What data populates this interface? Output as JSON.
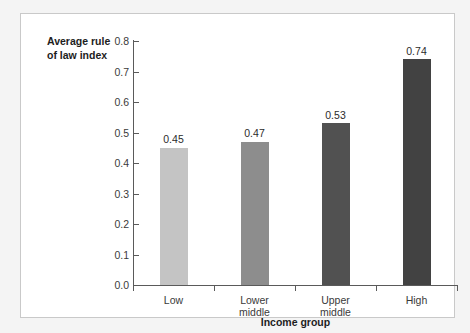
{
  "chart_data": {
    "type": "bar",
    "title": "",
    "xlabel": "Income group",
    "ylabel": "Average rule\nof law index",
    "categories": [
      "Low",
      "Lower\nmiddle",
      "Upper\nmiddle",
      "High"
    ],
    "values": [
      0.45,
      0.47,
      0.53,
      0.74
    ],
    "value_labels": [
      "0.45",
      "0.47",
      "0.53",
      "0.74"
    ],
    "bar_colors": [
      "#c4c4c4",
      "#8d8d8d",
      "#515151",
      "#424242"
    ],
    "ylim": [
      0.0,
      0.8
    ],
    "ytick_labels": [
      "0.8",
      "0.7",
      "0.6",
      "0.5",
      "0.4",
      "0.3",
      "0.2",
      "0.1",
      "0.0"
    ],
    "ytick_values": [
      0.8,
      0.7,
      0.6,
      0.5,
      0.4,
      0.3,
      0.2,
      0.1,
      0.0
    ],
    "grid": false,
    "legend": "none",
    "axis_color": "#5a5a5a",
    "frame_color": "#c9c9c9",
    "background": "#ffffff",
    "page_background": "#f4f4f4"
  }
}
